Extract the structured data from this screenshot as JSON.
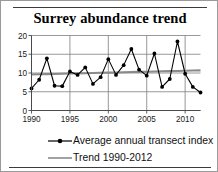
{
  "chart_data": {
    "type": "line",
    "title": "Surrey abundance trend",
    "xlabel": "",
    "ylabel": "",
    "xlim": [
      1990,
      2012
    ],
    "ylim": [
      0,
      20
    ],
    "yticks": [
      0,
      5,
      10,
      15,
      20
    ],
    "xticks": [
      1990,
      1995,
      2000,
      2005,
      2010
    ],
    "grid": true,
    "legend_position": "bottom",
    "x": [
      1990,
      1991,
      1992,
      1993,
      1994,
      1995,
      1996,
      1997,
      1998,
      1999,
      2000,
      2001,
      2002,
      2003,
      2004,
      2005,
      2006,
      2007,
      2008,
      2009,
      2010,
      2011,
      2012
    ],
    "series": [
      {
        "name": "Average annual transect index",
        "marker": "filled-circle",
        "color": "#000000",
        "values": [
          5.9,
          8.2,
          13.9,
          6.6,
          6.5,
          10.4,
          9.5,
          11.5,
          7.1,
          8.9,
          13.7,
          9.5,
          12.1,
          16.4,
          10.9,
          9.3,
          15.2,
          6.3,
          8.4,
          18.4,
          9.8,
          6.3,
          4.8
        ]
      },
      {
        "name": "Trend 1990-2012",
        "marker": "none",
        "color": "#8a8a8a",
        "values": [
          9.6,
          9.65,
          9.7,
          9.75,
          9.8,
          9.85,
          9.9,
          9.95,
          10.0,
          10.05,
          10.1,
          10.15,
          10.2,
          10.25,
          10.3,
          10.35,
          10.4,
          10.45,
          10.5,
          10.55,
          10.6,
          10.65,
          10.7
        ]
      }
    ]
  },
  "legend": {
    "items": [
      {
        "label": "Average annual transect index",
        "key": "line-with-marker"
      },
      {
        "label": "Trend 1990-2012",
        "key": "plain-line"
      }
    ]
  }
}
